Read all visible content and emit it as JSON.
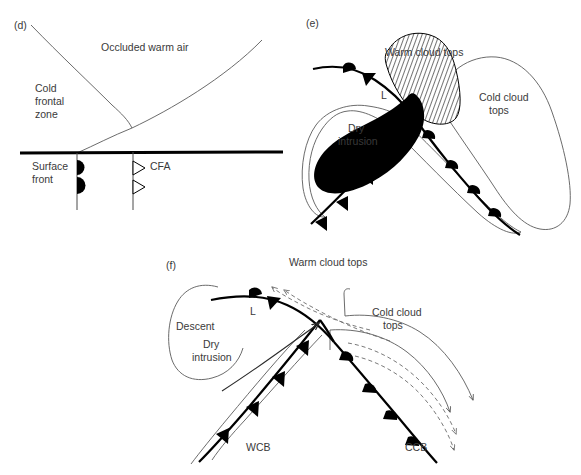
{
  "figure": {
    "background_color": "#ffffff",
    "line_color": "#000000",
    "thin_line_color": "#5a5a5a",
    "text_color": "#3a3a3a",
    "dry_intrusion_fill": "#000000",
    "warm_cloud_hatch": "diagonal-hatch"
  },
  "panels": {
    "d": {
      "tag": "(d)",
      "type": "vertical-cross-section",
      "labels": {
        "occluded_warm_air": "Occluded warm air",
        "cold_frontal_zone": "Cold\nfrontal\nzone",
        "cold_frontal_zone_lines": [
          "Cold",
          "frontal",
          "zone"
        ],
        "surface_front": "Surface\nfront",
        "surface_front_lines": [
          "Surface",
          "front"
        ],
        "cfa": "CFA"
      },
      "symbols": {
        "warm_front": "filled-semicircles",
        "cfa_front": "open-triangles"
      }
    },
    "e": {
      "tag": "(e)",
      "type": "plan-view",
      "labels": {
        "warm_cloud_tops": "Warm cloud tops",
        "low_center": "L",
        "dry_intrusion": "Dry\nintrusion",
        "dry_intrusion_lines": [
          "Dry",
          "intrusion"
        ],
        "cold_cloud_tops": "Cold cloud\ntops",
        "cold_cloud_tops_lines": [
          "Cold cloud",
          "tops"
        ]
      },
      "symbols": {
        "cold_front": "filled-triangles",
        "warm_front": "filled-semicircles"
      }
    },
    "f": {
      "tag": "(f)",
      "type": "plan-view-with-flow",
      "labels": {
        "warm_cloud_tops": "Warm cloud tops",
        "descent": "Descent",
        "dry_intrusion": "Dry\nintrusion",
        "dry_intrusion_lines": [
          "Dry",
          "intrusion"
        ],
        "low_center": "L",
        "cold_cloud_tops": "Cold cloud\ntops",
        "cold_cloud_tops_lines": [
          "Cold cloud",
          "tops"
        ],
        "wcb": "WCB",
        "ccb": "CCB"
      },
      "symbols": {
        "cold_front": "filled-triangles",
        "warm_front": "filled-semicircles",
        "flow_arrows": "dashed-arrows"
      }
    }
  }
}
